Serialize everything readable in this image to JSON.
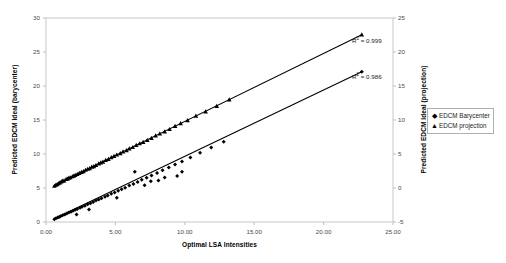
{
  "chart_data": {
    "type": "scatter",
    "title": "",
    "xlabel": "Optimal LSA Intensities",
    "ylabel_left": "Predicted EDCM Ideal (barycenter)",
    "ylabel_right": "Predicted EDCM Ideal (projection)",
    "xlim": [
      0,
      25
    ],
    "ylim_left": [
      0,
      30
    ],
    "ylim_right": [
      -5,
      25
    ],
    "grid": false,
    "legend_position": "right",
    "xticks": [
      "0.00",
      "5.00",
      "10.00",
      "15.00",
      "20.00",
      "25.00"
    ],
    "xtick_values": [
      0,
      5,
      10,
      15,
      20,
      25
    ],
    "yticks_left": [
      "0",
      "5",
      "10",
      "15",
      "20",
      "25",
      "30"
    ],
    "ytick_values_left": [
      0,
      5,
      10,
      15,
      20,
      25,
      30
    ],
    "yticks_right": [
      "-5",
      "0",
      "5",
      "10",
      "15",
      "20",
      "25"
    ],
    "ytick_values_right": [
      -5,
      0,
      5,
      10,
      15,
      20,
      25
    ],
    "annotations": [
      {
        "id": "r2-upper",
        "text": "R",
        "sup": "2",
        "rest": " = 0.999",
        "series": "EDCM projection"
      },
      {
        "id": "r2-lower",
        "text": "R",
        "sup": "2",
        "rest": " = 0.986",
        "series": "EDCM Barycenter"
      }
    ],
    "series": [
      {
        "name": "EDCM projection",
        "marker": "triangle",
        "axis": "left",
        "color": "#000000",
        "r_squared": 0.999,
        "trendline": {
          "x0": 0.55,
          "y0": 5.35,
          "x1": 22.75,
          "y1": 27.55
        },
        "points": [
          [
            0.6,
            5.3
          ],
          [
            0.7,
            5.45
          ],
          [
            0.8,
            5.55
          ],
          [
            0.9,
            5.7
          ],
          [
            1.0,
            5.8
          ],
          [
            1.1,
            5.95
          ],
          [
            1.2,
            6.05
          ],
          [
            1.3,
            6.1
          ],
          [
            1.45,
            6.3
          ],
          [
            1.55,
            6.35
          ],
          [
            1.65,
            6.5
          ],
          [
            1.75,
            6.55
          ],
          [
            1.9,
            6.7
          ],
          [
            2.0,
            6.8
          ],
          [
            2.1,
            6.9
          ],
          [
            2.25,
            7.05
          ],
          [
            2.4,
            7.2
          ],
          [
            2.55,
            7.35
          ],
          [
            2.7,
            7.45
          ],
          [
            2.85,
            7.65
          ],
          [
            3.0,
            7.8
          ],
          [
            3.15,
            7.9
          ],
          [
            3.3,
            8.1
          ],
          [
            3.45,
            8.2
          ],
          [
            3.6,
            8.35
          ],
          [
            3.8,
            8.6
          ],
          [
            3.95,
            8.75
          ],
          [
            4.1,
            8.85
          ],
          [
            4.3,
            9.1
          ],
          [
            4.5,
            9.25
          ],
          [
            4.7,
            9.5
          ],
          [
            4.9,
            9.7
          ],
          [
            5.1,
            9.9
          ],
          [
            5.35,
            10.1
          ],
          [
            5.55,
            10.35
          ],
          [
            5.8,
            10.55
          ],
          [
            6.0,
            10.8
          ],
          [
            6.25,
            11.0
          ],
          [
            6.5,
            11.3
          ],
          [
            6.75,
            11.55
          ],
          [
            7.0,
            11.75
          ],
          [
            7.3,
            12.05
          ],
          [
            7.6,
            12.35
          ],
          [
            7.9,
            12.7
          ],
          [
            8.2,
            13.0
          ],
          [
            8.55,
            13.3
          ],
          [
            8.9,
            13.65
          ],
          [
            9.3,
            14.1
          ],
          [
            9.7,
            14.5
          ],
          [
            10.2,
            14.95
          ],
          [
            10.8,
            15.6
          ],
          [
            11.5,
            16.25
          ],
          [
            12.3,
            17.05
          ],
          [
            13.2,
            18.0
          ],
          [
            22.75,
            27.55
          ]
        ]
      },
      {
        "name": "EDCM Barycenter",
        "marker": "diamond",
        "axis": "left",
        "color": "#000000",
        "r_squared": 0.986,
        "trendline": {
          "x0": 0.55,
          "y0": 0.45,
          "x1": 22.75,
          "y1": 22.1
        },
        "points": [
          [
            0.6,
            0.4
          ],
          [
            0.72,
            0.55
          ],
          [
            0.85,
            0.65
          ],
          [
            0.95,
            0.75
          ],
          [
            1.05,
            0.85
          ],
          [
            1.2,
            1.0
          ],
          [
            1.35,
            1.1
          ],
          [
            1.5,
            1.25
          ],
          [
            1.65,
            1.4
          ],
          [
            1.8,
            1.5
          ],
          [
            1.95,
            1.65
          ],
          [
            2.1,
            1.8
          ],
          [
            2.25,
            1.9
          ],
          [
            2.45,
            2.1
          ],
          [
            2.6,
            2.25
          ],
          [
            2.8,
            2.4
          ],
          [
            3.0,
            2.6
          ],
          [
            3.2,
            2.75
          ],
          [
            3.4,
            2.95
          ],
          [
            3.6,
            3.15
          ],
          [
            3.8,
            3.3
          ],
          [
            4.0,
            3.5
          ],
          [
            4.25,
            3.7
          ],
          [
            4.45,
            3.9
          ],
          [
            4.7,
            4.15
          ],
          [
            4.95,
            4.35
          ],
          [
            5.2,
            4.6
          ],
          [
            5.45,
            4.8
          ],
          [
            5.7,
            5.05
          ],
          [
            6.0,
            5.35
          ],
          [
            6.3,
            5.6
          ],
          [
            6.6,
            5.9
          ],
          [
            6.9,
            6.2
          ],
          [
            7.25,
            6.5
          ],
          [
            7.6,
            6.85
          ],
          [
            8.0,
            7.2
          ],
          [
            8.4,
            7.6
          ],
          [
            8.85,
            8.0
          ],
          [
            9.3,
            8.45
          ],
          [
            9.8,
            8.9
          ],
          [
            10.4,
            9.5
          ],
          [
            11.1,
            10.2
          ],
          [
            11.9,
            10.95
          ],
          [
            12.8,
            11.8
          ],
          [
            22.75,
            22.1
          ],
          [
            6.4,
            7.4
          ],
          [
            7.55,
            6.0
          ],
          [
            8.55,
            6.55
          ],
          [
            9.45,
            6.75
          ],
          [
            9.8,
            7.4
          ],
          [
            2.2,
            1.1
          ],
          [
            5.1,
            3.55
          ],
          [
            3.1,
            1.85
          ],
          [
            7.1,
            5.4
          ],
          [
            8.1,
            6.1
          ]
        ]
      }
    ]
  },
  "legend": {
    "items": [
      {
        "label": "EDCM Barycenter",
        "marker": "◆"
      },
      {
        "label": "EDCM projection",
        "marker": "▲"
      }
    ]
  }
}
